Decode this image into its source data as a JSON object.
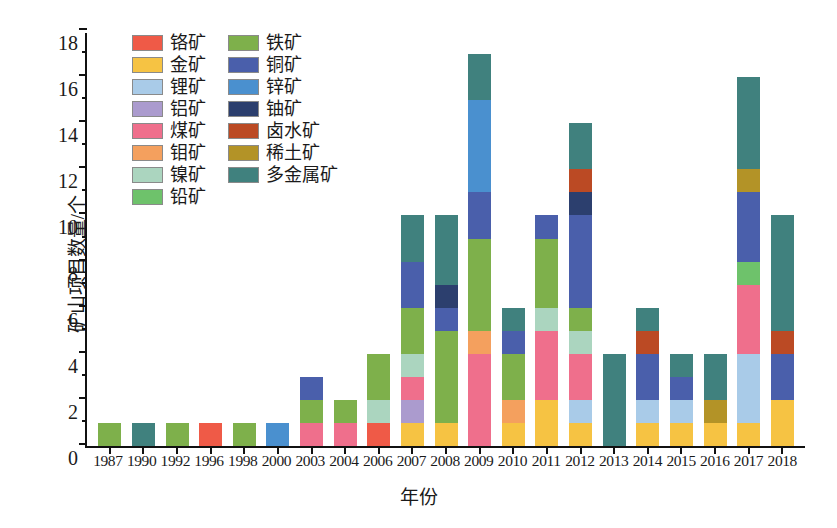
{
  "chart_data": {
    "type": "bar",
    "stacked": true,
    "title": "",
    "xlabel": "年份",
    "ylabel": "矿山项目数量/个",
    "ylim": [
      0,
      18
    ],
    "ytick_step": 2,
    "yticks": [
      "0",
      "2",
      "4",
      "6",
      "8",
      "10",
      "12",
      "14",
      "16",
      "18"
    ],
    "grid": false,
    "legend_position": "inside-top-left",
    "categories": [
      "1987",
      "1990",
      "1992",
      "1996",
      "1998",
      "2000",
      "2003",
      "2004",
      "2006",
      "2007",
      "2008",
      "2009",
      "2010",
      "2011",
      "2012",
      "2013",
      "2014",
      "2015",
      "2016",
      "2017",
      "2018"
    ],
    "series": [
      {
        "name": "铬矿",
        "color": "#ef5a47",
        "values": [
          0,
          0,
          0,
          1,
          0,
          0,
          0,
          0,
          1,
          0,
          0,
          0,
          0,
          0,
          0,
          0,
          0,
          0,
          0,
          0,
          0
        ]
      },
      {
        "name": "金矿",
        "color": "#f6c343",
        "values": [
          0,
          0,
          0,
          0,
          0,
          0,
          0,
          0,
          0,
          1,
          1,
          0,
          1,
          2,
          1,
          0,
          1,
          1,
          1,
          1,
          2
        ]
      },
      {
        "name": "锂矿",
        "color": "#a9cbe8",
        "values": [
          0,
          0,
          0,
          0,
          0,
          0,
          0,
          0,
          0,
          0,
          0,
          0,
          0,
          0,
          1,
          0,
          1,
          1,
          0,
          3,
          0
        ]
      },
      {
        "name": "铝矿",
        "color": "#ab9bce",
        "values": [
          0,
          0,
          0,
          0,
          0,
          0,
          0,
          0,
          0,
          1,
          0,
          0,
          0,
          0,
          0,
          0,
          0,
          0,
          0,
          0,
          0
        ]
      },
      {
        "name": "煤矿",
        "color": "#ef6f8c",
        "values": [
          0,
          0,
          0,
          0,
          0,
          0,
          1,
          1,
          0,
          1,
          0,
          4,
          0,
          3,
          2,
          0,
          0,
          0,
          0,
          3,
          0
        ]
      },
      {
        "name": "钼矿",
        "color": "#f4a05e",
        "values": [
          0,
          0,
          0,
          0,
          0,
          0,
          0,
          0,
          0,
          0,
          0,
          1,
          1,
          0,
          0,
          0,
          0,
          0,
          0,
          0,
          0
        ]
      },
      {
        "name": "镍矿",
        "color": "#abd5bf",
        "values": [
          0,
          0,
          0,
          0,
          0,
          0,
          0,
          0,
          1,
          1,
          0,
          0,
          0,
          1,
          1,
          0,
          0,
          0,
          0,
          0,
          0
        ]
      },
      {
        "name": "铅矿",
        "color": "#6ec26b",
        "values": [
          0,
          0,
          0,
          0,
          0,
          0,
          0,
          0,
          0,
          0,
          0,
          0,
          0,
          0,
          0,
          0,
          0,
          0,
          0,
          1,
          0
        ]
      },
      {
        "name": "铁矿",
        "color": "#7eb04b",
        "values": [
          1,
          0,
          1,
          0,
          1,
          0,
          1,
          1,
          2,
          2,
          4,
          4,
          2,
          3,
          1,
          0,
          0,
          0,
          0,
          0,
          0
        ]
      },
      {
        "name": "铜矿",
        "color": "#4a5fab",
        "values": [
          0,
          0,
          0,
          0,
          0,
          0,
          1,
          0,
          0,
          2,
          1,
          2,
          1,
          1,
          4,
          0,
          2,
          1,
          0,
          3,
          2
        ]
      },
      {
        "name": "锌矿",
        "color": "#4a90cf",
        "values": [
          0,
          0,
          0,
          0,
          0,
          1,
          0,
          0,
          0,
          0,
          0,
          4,
          0,
          0,
          0,
          0,
          0,
          0,
          0,
          0,
          0
        ]
      },
      {
        "name": "铀矿",
        "color": "#2c3f6e",
        "values": [
          0,
          0,
          0,
          0,
          0,
          0,
          0,
          0,
          0,
          0,
          1,
          0,
          0,
          0,
          1,
          0,
          0,
          0,
          0,
          0,
          0
        ]
      },
      {
        "name": "卤水矿",
        "color": "#bb4a24",
        "values": [
          0,
          0,
          0,
          0,
          0,
          0,
          0,
          0,
          0,
          0,
          0,
          0,
          0,
          0,
          1,
          0,
          1,
          0,
          0,
          0,
          1
        ]
      },
      {
        "name": "稀土矿",
        "color": "#b39327",
        "values": [
          0,
          0,
          0,
          0,
          0,
          0,
          0,
          0,
          0,
          0,
          0,
          0,
          0,
          0,
          0,
          0,
          0,
          0,
          1,
          1,
          0
        ]
      },
      {
        "name": "多金属矿",
        "color": "#40817e",
        "values": [
          0,
          1,
          0,
          0,
          0,
          0,
          0,
          0,
          0,
          2,
          3,
          2,
          1,
          0,
          2,
          4,
          1,
          1,
          2,
          4,
          5
        ]
      }
    ],
    "totals": [
      1,
      1,
      1,
      1,
      1,
      1,
      3,
      2,
      4,
      10,
      10,
      17,
      6,
      10,
      14,
      4,
      6,
      4,
      4,
      16,
      10
    ]
  },
  "legend": {
    "column_left": [
      "铬矿",
      "金矿",
      "锂矿",
      "铝矿",
      "煤矿",
      "钼矿",
      "镍矿",
      "铅矿"
    ],
    "column_right": [
      "铁矿",
      "铜矿",
      "锌矿",
      "铀矿",
      "卤水矿",
      "稀土矿",
      "多金属矿"
    ]
  },
  "axes": {
    "y_title": "矿山项目数量/个",
    "x_title": "年份"
  },
  "caption": ""
}
